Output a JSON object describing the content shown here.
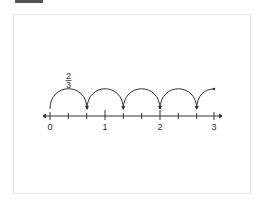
{
  "diagram": {
    "type": "number-line-jumps",
    "jump_label": {
      "numerator": "2",
      "denominator": "3"
    },
    "axis": {
      "min": 0,
      "max": 3,
      "labels": [
        "0",
        "1",
        "2",
        "3"
      ],
      "subdivisions_per_unit": 3
    },
    "jumps": [
      {
        "from": "0",
        "to": "2/3"
      },
      {
        "from": "2/3",
        "to": "4/3"
      },
      {
        "from": "4/3",
        "to": "2"
      },
      {
        "from": "2",
        "to": "8/3"
      },
      {
        "from": "8/3",
        "to": "partial"
      }
    ],
    "colors": {
      "line": "#333333",
      "frame_border": "#e4e4e4",
      "top_bar": "#555555"
    }
  }
}
